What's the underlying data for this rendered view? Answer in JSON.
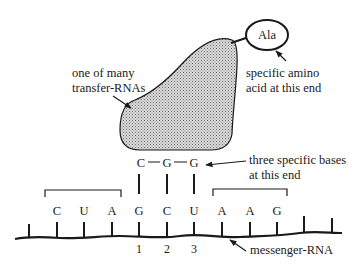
{
  "diagram": {
    "title": "",
    "trna": {
      "label_line1": "one of many",
      "label_line2": "transfer-RNAs",
      "anticodon": [
        "C",
        "G",
        "G"
      ],
      "fill_pattern": "stipple-gray"
    },
    "amino_acid": {
      "name": "Ala",
      "label_line1": "specific amino",
      "label_line2": "acid at this end"
    },
    "anticodon_label": {
      "line1": "three specific bases",
      "line2": "at this end"
    },
    "mrna": {
      "label": "messenger-RNA",
      "bases": [
        "C",
        "U",
        "A",
        "G",
        "C",
        "U",
        "A",
        "A",
        "G"
      ],
      "codon_numbers": [
        "1",
        "2",
        "3"
      ]
    },
    "colors": {
      "ink": "#1a1a1a",
      "trna_fill": "#bdbdbd",
      "background": "#ffffff"
    }
  }
}
